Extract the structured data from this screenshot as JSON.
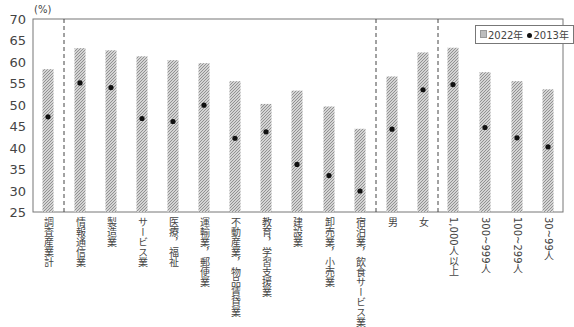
{
  "chart_data": {
    "type": "bar",
    "title": "",
    "ylabel": "(%)",
    "xlabel": "",
    "ylim": [
      25,
      70
    ],
    "yticks": [
      25,
      30,
      35,
      40,
      45,
      50,
      55,
      60,
      65,
      70
    ],
    "grid": false,
    "legend_position": "top-right",
    "categories": [
      "調査産業計",
      "情報通信業",
      "製造業",
      "サービス業",
      "医療，福祉",
      "運輸業，郵便業",
      "不動産業，物品賃貸業",
      "教育，学習支援業",
      "建設業",
      "卸売業，小売業",
      "宿泊業，飲食サービス業",
      "男",
      "女",
      "1,000人以上",
      "300~999人",
      "100~299人",
      "30~99人"
    ],
    "series": [
      {
        "name": "2022年",
        "style": "hatched-bar",
        "values": [
          58.3,
          63.2,
          62.7,
          61.3,
          60.4,
          59.7,
          55.5,
          50.2,
          53.3,
          49.6,
          44.4,
          56.6,
          62.2,
          63.3,
          57.6,
          55.5,
          53.6
        ]
      },
      {
        "name": "2013年",
        "style": "dot",
        "values": [
          47.2,
          55.1,
          54.0,
          46.8,
          46.1,
          49.9,
          42.2,
          43.7,
          36.1,
          33.5,
          29.9,
          44.3,
          53.5,
          54.7,
          44.7,
          42.3,
          40.2
        ]
      }
    ],
    "group_separators_after_index": [
      0,
      10,
      12
    ],
    "legend": [
      "2022年",
      "2013年"
    ]
  },
  "legend": {
    "series_2022": "2022年",
    "series_2013": "2013年"
  },
  "axis": {
    "unit": "(%)"
  }
}
